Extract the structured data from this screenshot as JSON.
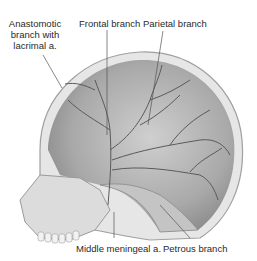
{
  "figure": {
    "labels": {
      "anastomotic": [
        "Anastomotic",
        "branch with",
        "lacrimal a."
      ],
      "frontal": "Frontal branch",
      "parietal": "Parietal branch",
      "middle_meningeal": "Middle meningeal a.",
      "petrous": "Petrous branch"
    },
    "colors": {
      "bone": "#d9d9d9",
      "bone_dark": "#9a9a9a",
      "inner_surface": "#bdbdbd",
      "vessel": "#5a5a5a",
      "leader": "#555555",
      "text": "#2a2a2a"
    }
  }
}
